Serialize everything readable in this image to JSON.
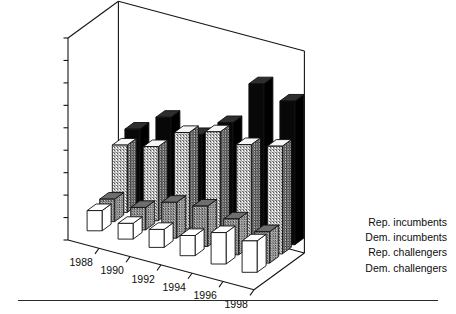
{
  "figure": {
    "kind": "3d-bar-chart",
    "background": "#ffffff",
    "axis_color": "#141414",
    "has_footer_rule": true
  },
  "chart_data": {
    "type": "bar",
    "title": "",
    "subtitle": "",
    "xlabel": "",
    "ylabel": "",
    "categories": [
      "1988",
      "1990",
      "1992",
      "1994",
      "1996",
      "1998"
    ],
    "ylim": [
      0,
      900000
    ],
    "ytick_values": [
      0,
      100000,
      200000,
      300000,
      400000,
      500000,
      600000,
      700000,
      800000,
      900000
    ],
    "ytick_labels": [
      "$0",
      "$100,000",
      "$200,000",
      "$300,000",
      "$400,000",
      "$500,000",
      "$600,000",
      "$700,000",
      "$800,000",
      "$900,000"
    ],
    "grid": false,
    "legend_position": "right-depth-axis",
    "projection": "3d-rows-in-depth",
    "series": [
      {
        "name": "Rep. incumbents",
        "depth_index": 0,
        "fill": "#080808",
        "fill_style": "solid-black",
        "values": [
          330000,
          420000,
          380000,
          470000,
          680000,
          640000
        ]
      },
      {
        "name": "Dem. incumbents",
        "depth_index": 1,
        "fill": "#d8d8d8",
        "fill_style": "light-stipple",
        "values": [
          300000,
          330000,
          430000,
          470000,
          450000,
          480000
        ]
      },
      {
        "name": "Rep. challengers",
        "depth_index": 2,
        "fill": "#3a3a3a",
        "fill_style": "dark-stipple",
        "values": [
          100000,
          100000,
          160000,
          180000,
          160000,
          140000
        ]
      },
      {
        "name": "Dem. challengers",
        "depth_index": 3,
        "fill": "#ffffff",
        "fill_style": "white",
        "values": [
          90000,
          70000,
          80000,
          90000,
          140000,
          140000
        ]
      }
    ]
  },
  "legend": {
    "entries": [
      {
        "label": "Rep. incumbents"
      },
      {
        "label": "Dem. incumbents"
      },
      {
        "label": "Rep. challengers"
      },
      {
        "label": "Dem. challengers"
      }
    ]
  }
}
